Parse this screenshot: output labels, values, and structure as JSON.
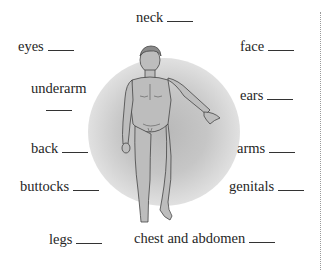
{
  "worksheet": {
    "labels": {
      "neck": "neck",
      "eyes": "eyes",
      "face": "face",
      "underarm": "underarm",
      "ears": "ears",
      "back": "back",
      "arms": "arms",
      "buttocks": "buttocks",
      "genitals": "genitals",
      "legs": "legs",
      "chest_and_abdomen": "chest and abdomen"
    },
    "figure": {
      "icon": "human-body-illustration",
      "description": "Front view of a standing man with left arm extended"
    },
    "colors": {
      "text": "#262626",
      "glow": "#c0c0c0",
      "figure_fill": "#bcbcbc",
      "divider": "#9a9a9a"
    }
  }
}
